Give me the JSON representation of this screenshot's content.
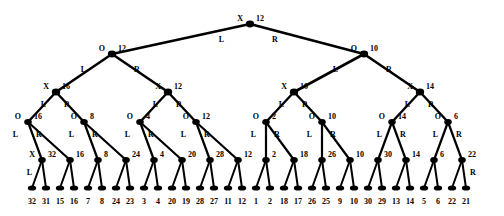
{
  "figure": {
    "name": "binary-tree-diagram",
    "node_color": "#000000",
    "edge_color": "#000000",
    "background": "#ffffff",
    "levels": [
      {
        "depth": 0,
        "op_label": "X",
        "nodes": [
          {
            "value": "12",
            "x": 250,
            "y": 24,
            "op": "X",
            "left_label": "L",
            "right_label": "R"
          }
        ]
      },
      {
        "depth": 1,
        "op_label": "O",
        "nodes": [
          {
            "value": "12",
            "x": 112,
            "y": 54,
            "op": "O",
            "left_label": "L",
            "right_label": "R"
          },
          {
            "value": "10",
            "x": 364,
            "y": 54,
            "op": "O",
            "left_label": "L",
            "right_label": "R"
          }
        ]
      },
      {
        "depth": 2,
        "op_label": "X",
        "nodes": [
          {
            "value": "16",
            "x": 56,
            "y": 92,
            "op": "X",
            "left_label": "L",
            "right_label": "R"
          },
          {
            "value": "12",
            "x": 168,
            "y": 92,
            "op": "X",
            "left_label": "L",
            "right_label": "R"
          },
          {
            "value": "10",
            "x": 294,
            "y": 92,
            "op": "X",
            "left_label": "L",
            "right_label": "R"
          },
          {
            "value": "14",
            "x": 420,
            "y": 92,
            "op": "X",
            "left_label": "L",
            "right_label": "R"
          }
        ]
      },
      {
        "depth": 3,
        "op_label": "O",
        "nodes": [
          {
            "value": "16",
            "x": 28,
            "y": 122,
            "op": "O",
            "left_label": "L",
            "right_label": "R"
          },
          {
            "value": "8",
            "x": 84,
            "y": 122,
            "op": "O",
            "left_label": "L",
            "right_label": "R"
          },
          {
            "value": "4",
            "x": 140,
            "y": 122,
            "op": "O",
            "left_label": "L",
            "right_label": "R"
          },
          {
            "value": "12",
            "x": 196,
            "y": 122,
            "op": "O",
            "left_label": "L",
            "right_label": "R"
          },
          {
            "value": "2",
            "x": 266,
            "y": 122,
            "op": "O",
            "left_label": "L",
            "right_label": "R"
          },
          {
            "value": "10",
            "x": 322,
            "y": 122,
            "op": "O",
            "left_label": "L",
            "right_label": "R"
          },
          {
            "value": "14",
            "x": 392,
            "y": 122,
            "op": "O",
            "left_label": "L",
            "right_label": "R"
          },
          {
            "value": "6",
            "x": 448,
            "y": 122,
            "op": "O",
            "left_label": "L",
            "right_label": "R"
          }
        ]
      },
      {
        "depth": 4,
        "op_label": "X",
        "nodes": [
          {
            "value": "32",
            "x": 42,
            "y": 160,
            "op": "X",
            "left_label": "L",
            "right_label": ""
          },
          {
            "value": "16",
            "x": 70,
            "y": 160
          },
          {
            "value": "8",
            "x": 98,
            "y": 160
          },
          {
            "value": "24",
            "x": 126,
            "y": 160
          },
          {
            "value": "4",
            "x": 154,
            "y": 160
          },
          {
            "value": "20",
            "x": 182,
            "y": 160
          },
          {
            "value": "28",
            "x": 210,
            "y": 160
          },
          {
            "value": "12",
            "x": 238,
            "y": 160
          },
          {
            "value": "2",
            "x": 266,
            "y": 160
          },
          {
            "value": "18",
            "x": 294,
            "y": 160
          },
          {
            "value": "26",
            "x": 322,
            "y": 160
          },
          {
            "value": "10",
            "x": 350,
            "y": 160
          },
          {
            "value": "30",
            "x": 378,
            "y": 160
          },
          {
            "value": "14",
            "x": 406,
            "y": 160
          },
          {
            "value": "6",
            "x": 434,
            "y": 160
          },
          {
            "value": "22",
            "x": 462,
            "y": 160,
            "right_label": "R"
          }
        ]
      }
    ],
    "leaves": {
      "y": 188,
      "label_y": 198,
      "values": [
        "32",
        "31",
        "15",
        "16",
        "7",
        "8",
        "24",
        "23",
        "3",
        "4",
        "20",
        "19",
        "28",
        "27",
        "11",
        "12",
        "1",
        "2",
        "18",
        "17",
        "26",
        "25",
        "9",
        "10",
        "30",
        "29",
        "13",
        "14",
        "5",
        "6",
        "22",
        "21"
      ],
      "x": [
        32,
        46,
        60,
        74,
        88,
        102,
        116,
        130,
        144,
        158,
        172,
        186,
        200,
        214,
        228,
        242,
        256,
        270,
        284,
        298,
        312,
        326,
        340,
        354,
        368,
        382,
        396,
        410,
        424,
        438,
        452,
        466
      ]
    },
    "edge_side_labels": {
      "left": "L",
      "right": "R"
    }
  }
}
